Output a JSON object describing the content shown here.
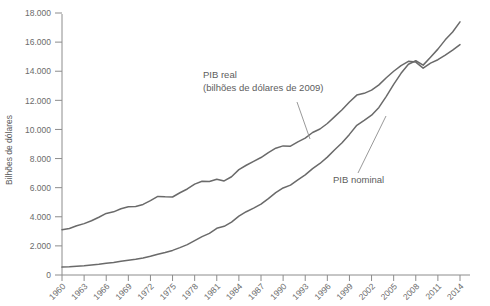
{
  "chart_data": {
    "type": "line",
    "title": "",
    "xlabel": "",
    "ylabel": "Bilhões de dólares",
    "xlim": [
      1960,
      2014
    ],
    "ylim": [
      0,
      18000
    ],
    "grid": false,
    "legend_position": "inline-annotations",
    "y_ticks": [
      "0",
      "2.000",
      "4.000",
      "6.000",
      "8.000",
      "10.000",
      "12.000",
      "14.000",
      "16.000",
      "18.000"
    ],
    "y_tick_values": [
      0,
      2000,
      4000,
      6000,
      8000,
      10000,
      12000,
      14000,
      16000,
      18000
    ],
    "x_ticks": [
      "1960",
      "1963",
      "1966",
      "1969",
      "1972",
      "1975",
      "1978",
      "1981",
      "1984",
      "1987",
      "1990",
      "1993",
      "1996",
      "1999",
      "2002",
      "2005",
      "2008",
      "2011",
      "2014"
    ],
    "x_tick_values": [
      1960,
      1963,
      1966,
      1969,
      1972,
      1975,
      1978,
      1981,
      1984,
      1987,
      1990,
      1993,
      1996,
      1999,
      2002,
      2005,
      2008,
      2011,
      2014
    ],
    "annotations": [
      {
        "name": "pib-real",
        "lines": [
          "PIB real",
          "(bilhões de dólares de 2009)"
        ],
        "x": 203,
        "y": 78
      },
      {
        "name": "pib-nominal",
        "lines": [
          "PIB nominal"
        ],
        "x": 333,
        "y": 183
      }
    ],
    "series": [
      {
        "name": "PIB real (bilhões de dólares de 2009)",
        "color": "#6a6a6a",
        "x": [
          1960,
          1961,
          1962,
          1963,
          1964,
          1965,
          1966,
          1967,
          1968,
          1969,
          1970,
          1971,
          1972,
          1973,
          1974,
          1975,
          1976,
          1977,
          1978,
          1979,
          1980,
          1981,
          1982,
          1983,
          1984,
          1985,
          1986,
          1987,
          1988,
          1989,
          1990,
          1991,
          1992,
          1993,
          1994,
          1995,
          1996,
          1997,
          1998,
          1999,
          2000,
          2001,
          2002,
          2003,
          2004,
          2005,
          2006,
          2007,
          2008,
          2009,
          2010,
          2011,
          2012,
          2013,
          2014
        ],
        "values": [
          3110,
          3190,
          3380,
          3530,
          3730,
          3970,
          4230,
          4340,
          4550,
          4690,
          4700,
          4850,
          5110,
          5400,
          5370,
          5360,
          5650,
          5910,
          6240,
          6440,
          6420,
          6580,
          6460,
          6750,
          7240,
          7540,
          7810,
          8070,
          8410,
          8710,
          8870,
          8850,
          9150,
          9400,
          9790,
          10030,
          10410,
          10880,
          11350,
          11890,
          12360,
          12480,
          12700,
          13060,
          13550,
          14000,
          14390,
          14680,
          14630,
          14210,
          14560,
          14790,
          15110,
          15450,
          15830
        ]
      },
      {
        "name": "PIB nominal",
        "color": "#6a6a6a",
        "x": [
          1960,
          1961,
          1962,
          1963,
          1964,
          1965,
          1966,
          1967,
          1968,
          1969,
          1970,
          1971,
          1972,
          1973,
          1974,
          1975,
          1976,
          1977,
          1978,
          1979,
          1980,
          1981,
          1982,
          1983,
          1984,
          1985,
          1986,
          1987,
          1988,
          1989,
          1990,
          1991,
          1992,
          1993,
          1994,
          1995,
          1996,
          1997,
          1998,
          1999,
          2000,
          2001,
          2002,
          2003,
          2004,
          2005,
          2006,
          2007,
          2008,
          2009,
          2010,
          2011,
          2012,
          2013,
          2014
        ],
        "values": [
          543,
          563,
          605,
          638,
          685,
          743,
          815,
          862,
          943,
          1020,
          1076,
          1168,
          1282,
          1429,
          1549,
          1689,
          1878,
          2086,
          2357,
          2632,
          2863,
          3211,
          3345,
          3638,
          4041,
          4347,
          4590,
          4870,
          5253,
          5658,
          5980,
          6174,
          6539,
          6879,
          7309,
          7664,
          8100,
          8609,
          9089,
          9661,
          10285,
          10622,
          10978,
          11511,
          12275,
          13094,
          13856,
          14478,
          14719,
          14419,
          14964,
          15518,
          16155,
          16692,
          17393
        ]
      }
    ]
  }
}
